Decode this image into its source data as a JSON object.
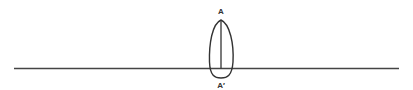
{
  "diagram": {
    "type": "geometric-figure",
    "labels": {
      "top": "A",
      "bottom": "A′"
    },
    "colors": {
      "stroke": "#333333",
      "background": "#ffffff"
    }
  }
}
